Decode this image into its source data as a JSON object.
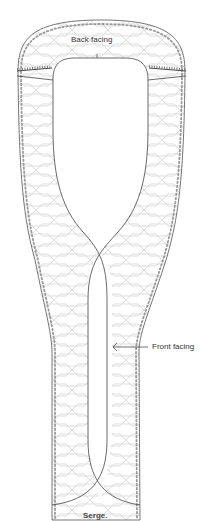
{
  "diagram": {
    "labels": {
      "back_facing": "Back facing",
      "front_facing": "Front facing"
    },
    "caption": "Serge.",
    "colors": {
      "outline": "#555555",
      "serge_pattern": "#cccccc",
      "serge_edge": "#888888",
      "background": "#ffffff"
    }
  }
}
